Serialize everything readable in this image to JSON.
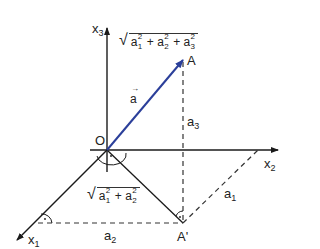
{
  "diagram": {
    "type": "3d-vector-coordinates",
    "colors": {
      "axis": "#1a1a1a",
      "vector": "#2b3f9a",
      "dashed": "#333333",
      "background": "#ffffff"
    },
    "points": {
      "origin": {
        "label": "O"
      },
      "tip": {
        "label": "A"
      },
      "projection": {
        "label": "A'"
      }
    },
    "axes": [
      {
        "name": "x",
        "sub": "1"
      },
      {
        "name": "x",
        "sub": "2"
      },
      {
        "name": "x",
        "sub": "3"
      }
    ],
    "vector": {
      "label": "a⃗",
      "text": "a"
    },
    "components": [
      {
        "name": "a",
        "sub": "1"
      },
      {
        "name": "a",
        "sub": "2"
      },
      {
        "name": "a",
        "sub": "3"
      }
    ],
    "formulas": {
      "magnitude_3d": {
        "terms": [
          "1",
          "2",
          "3"
        ],
        "plus": "+",
        "sq": "2",
        "var": "a"
      },
      "magnitude_2d": {
        "terms": [
          "1",
          "2"
        ],
        "plus": "+",
        "sq": "2",
        "var": "a"
      }
    },
    "radical": "√",
    "right_angle_dot": "·"
  }
}
